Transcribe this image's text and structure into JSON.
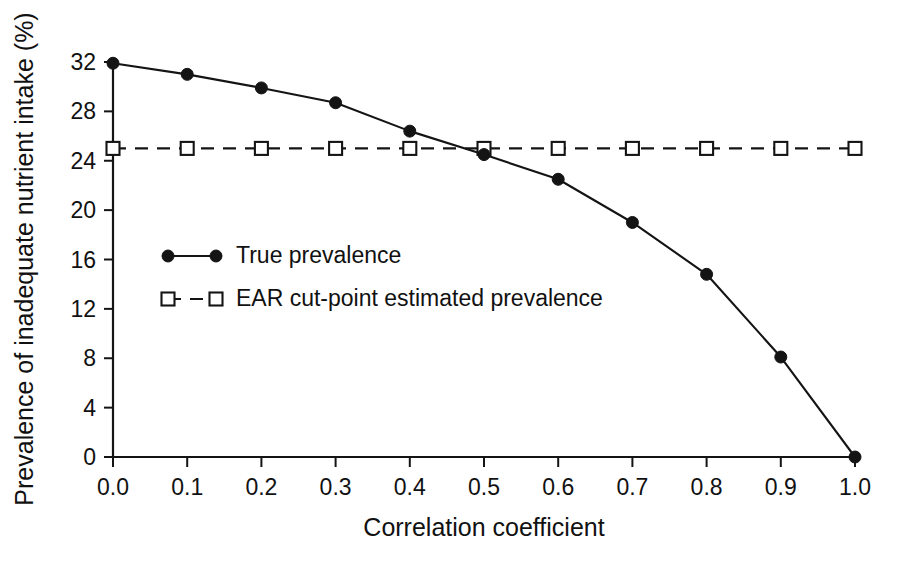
{
  "chart_data": {
    "type": "line",
    "title": "",
    "xlabel": "Correlation coefficient",
    "ylabel": "Prevalence of inadequate nutrient intake (%)",
    "x": [
      0.0,
      0.1,
      0.2,
      0.3,
      0.4,
      0.5,
      0.6,
      0.7,
      0.8,
      0.9,
      1.0
    ],
    "xlim": [
      0.0,
      1.0
    ],
    "ylim": [
      0,
      32
    ],
    "grid": false,
    "legend_position": "center-left",
    "xticklabels": [
      "0.0",
      "0.1",
      "0.2",
      "0.3",
      "0.4",
      "0.5",
      "0.6",
      "0.7",
      "0.8",
      "0.9",
      "1.0"
    ],
    "yticks": [
      0,
      4,
      8,
      12,
      16,
      20,
      24,
      28,
      32
    ],
    "yticklabels": [
      "0",
      "4",
      "8",
      "12",
      "16",
      "20",
      "24",
      "28",
      "32"
    ],
    "series": [
      {
        "name": "True prevalence",
        "marker": "filled-circle",
        "linestyle": "solid",
        "color": "#141414",
        "values": [
          31.9,
          31.0,
          29.9,
          28.7,
          26.4,
          24.5,
          22.5,
          19.0,
          14.8,
          8.1,
          0.0
        ]
      },
      {
        "name": "EAR cut-point estimated prevalence",
        "marker": "open-square",
        "linestyle": "dashed",
        "color": "#141414",
        "values": [
          25.0,
          25.0,
          25.0,
          25.0,
          25.0,
          25.0,
          25.0,
          25.0,
          25.0,
          25.0,
          25.0
        ]
      }
    ]
  },
  "legend": {
    "entries": [
      {
        "label": "True prevalence",
        "marker": "filled-circle",
        "linestyle": "solid"
      },
      {
        "label": "EAR cut-point estimated prevalence",
        "marker": "open-square",
        "linestyle": "dashed"
      }
    ]
  },
  "colors": {
    "ink": "#141414",
    "background": "#ffffff"
  }
}
